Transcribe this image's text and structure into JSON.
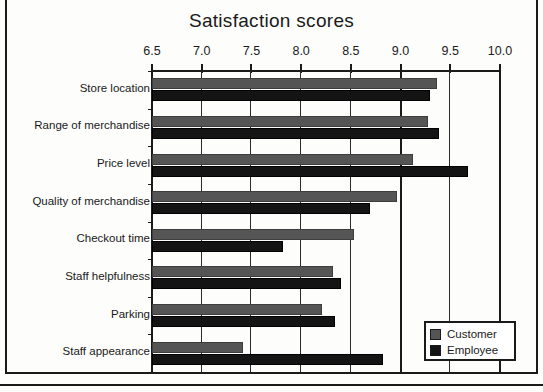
{
  "chart_data": {
    "type": "bar",
    "orientation": "horizontal",
    "title": "Satisfaction scores",
    "xlabel": "",
    "ylabel": "",
    "xlim": [
      6.5,
      10.0
    ],
    "xticks": [
      "6.5",
      "7.0",
      "7.5",
      "8.0",
      "8.5",
      "9.0",
      "9.5",
      "10.0"
    ],
    "xtick_values": [
      6.5,
      7.0,
      7.5,
      8.0,
      8.5,
      9.0,
      9.5,
      10.0
    ],
    "grid": true,
    "legend_position": "bottom-right",
    "categories": [
      "Store location",
      "Range of merchandise",
      "Price level",
      "Quality of merchandise",
      "Checkout time",
      "Staff helpfulness",
      "Parking",
      "Staff appearance"
    ],
    "series": [
      {
        "name": "Customer",
        "color": "#555555",
        "values": [
          9.37,
          9.28,
          9.13,
          8.96,
          8.53,
          8.32,
          8.21,
          7.42
        ]
      },
      {
        "name": "Employee",
        "color": "#141414",
        "values": [
          9.3,
          9.39,
          9.68,
          8.69,
          7.82,
          8.4,
          8.34,
          8.82
        ]
      }
    ]
  },
  "legend": {
    "items": [
      {
        "label": "Customer",
        "swatch": "#555555"
      },
      {
        "label": "Employee",
        "swatch": "#141414"
      }
    ]
  }
}
